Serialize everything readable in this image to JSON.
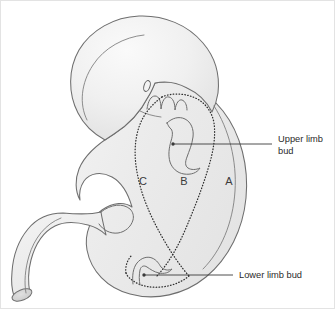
{
  "figure": {
    "background_color": "#ffffff",
    "body_fill_color": "#ececec",
    "body_outline_color": "#6e6e6e",
    "dotted_boundary_color": "#2f2f2f",
    "text_color": "#2b2b2b"
  },
  "region_labels": [
    {
      "id": "region-c",
      "text": "C",
      "x": 142,
      "y": 184
    },
    {
      "id": "region-b",
      "text": "B",
      "x": 183,
      "y": 184
    },
    {
      "id": "region-a",
      "text": "A",
      "x": 228,
      "y": 184
    }
  ],
  "callouts": [
    {
      "id": "upper-limb-bud",
      "lines": [
        "Upper limb",
        "bud"
      ],
      "line1": "Upper limb",
      "line2": "bud",
      "text_x": 277,
      "text_y1": 141,
      "text_y2": 153,
      "leader_dot_x": 172,
      "leader_dot_y": 143,
      "leader_end_x": 271,
      "leader_end_y": 143
    },
    {
      "id": "lower-limb-bud",
      "lines": [
        "Lower limb bud"
      ],
      "line1": "Lower limb bud",
      "line2": "",
      "text_x": 238,
      "text_y1": 277,
      "text_y2": 277,
      "leader_dot_x": 143,
      "leader_dot_y": 274,
      "leader_end_x": 232,
      "leader_end_y": 274
    }
  ],
  "anatomy_parts": [
    {
      "id": "head",
      "name": "head"
    },
    {
      "id": "eye",
      "name": "eye"
    },
    {
      "id": "pharyngeal-arches",
      "name": "pharyngeal arches"
    },
    {
      "id": "trunk",
      "name": "trunk"
    },
    {
      "id": "tail",
      "name": "tail"
    },
    {
      "id": "upper-limb-bud-shape",
      "name": "upper limb bud"
    },
    {
      "id": "lower-limb-bud-shape",
      "name": "lower limb bud"
    }
  ]
}
